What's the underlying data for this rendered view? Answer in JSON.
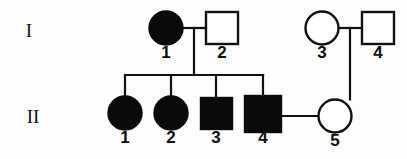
{
  "diagram": {
    "type": "pedigree",
    "generations": [
      {
        "id": "I",
        "label": "I",
        "label_x": 29,
        "label_y": 33
      },
      {
        "id": "II",
        "label": "II",
        "label_y": 119,
        "label_x": 33
      }
    ],
    "legend": {
      "filled_meaning": "affected",
      "open_meaning": "unaffected",
      "circle_meaning": "female",
      "square_meaning": "male"
    },
    "colors": {
      "ink": "#111111",
      "affected_fill": "#0a0a0a",
      "unaffected_fill": "#ffffff",
      "background": "#fdfdfd"
    },
    "individuals": [
      {
        "key": "I-1",
        "generation": "I",
        "number": "1",
        "sex": "female",
        "shape": "circle",
        "affected": true,
        "cx": 166,
        "cy": 28,
        "r": 16.5,
        "label_x": 166,
        "label_y": 46
      },
      {
        "key": "I-2",
        "generation": "I",
        "number": "2",
        "sex": "male",
        "shape": "square",
        "affected": false,
        "x": 206,
        "y": 12,
        "size": 32,
        "label_x": 222,
        "label_y": 46
      },
      {
        "key": "I-3",
        "generation": "I",
        "number": "3",
        "sex": "female",
        "shape": "circle",
        "affected": false,
        "cx": 322,
        "cy": 28,
        "r": 16.5,
        "label_x": 322,
        "label_y": 46
      },
      {
        "key": "I-4",
        "generation": "I",
        "number": "4",
        "sex": "male",
        "shape": "square",
        "affected": false,
        "x": 362,
        "y": 12,
        "size": 32,
        "label_x": 378,
        "label_y": 46
      },
      {
        "key": "II-1",
        "generation": "II",
        "number": "1",
        "sex": "female",
        "shape": "circle",
        "affected": true,
        "cx": 125,
        "cy": 113,
        "r": 16.5,
        "label_x": 125,
        "label_y": 131
      },
      {
        "key": "II-2",
        "generation": "II",
        "number": "2",
        "sex": "female",
        "shape": "circle",
        "affected": true,
        "cx": 171,
        "cy": 113,
        "r": 16.5,
        "label_x": 171,
        "label_y": 131
      },
      {
        "key": "II-3",
        "generation": "II",
        "number": "3",
        "sex": "male",
        "shape": "square",
        "affected": true,
        "x": 201,
        "y": 98,
        "size": 31,
        "label_x": 216,
        "label_y": 131
      },
      {
        "key": "II-4",
        "generation": "II",
        "number": "4",
        "sex": "male",
        "shape": "square",
        "affected": true,
        "x": 245,
        "y": 96,
        "size": 36,
        "label_x": 263,
        "label_y": 131
      },
      {
        "key": "II-5",
        "generation": "II",
        "number": "5",
        "sex": "female",
        "shape": "circle",
        "affected": false,
        "cx": 335,
        "cy": 116,
        "r": 16.5,
        "label_x": 335,
        "label_y": 134
      }
    ],
    "matings": [
      {
        "key": "I-1-x-I-2",
        "x1": 182.5,
        "y1": 28,
        "x2": 206,
        "y2": 28
      },
      {
        "key": "I-3-x-I-4",
        "x1": 338.5,
        "y1": 28,
        "x2": 362,
        "y2": 28
      },
      {
        "key": "II-4-x-II-5",
        "x1": 281,
        "y1": 116,
        "x2": 318.5,
        "y2": 116
      }
    ],
    "descent_lines": [
      {
        "key": "drop-from-I1-I2",
        "x1": 194,
        "y1": 28,
        "x2": 194,
        "y2": 75
      },
      {
        "key": "sibship-bar-gen2",
        "x1": 125,
        "y1": 75,
        "x2": 263,
        "y2": 75
      },
      {
        "key": "drop-to-II-1",
        "x1": 125,
        "y1": 75,
        "x2": 125,
        "y2": 97
      },
      {
        "key": "drop-to-II-2",
        "x1": 171,
        "y1": 75,
        "x2": 171,
        "y2": 97
      },
      {
        "key": "drop-to-II-3",
        "x1": 216,
        "y1": 75,
        "x2": 216,
        "y2": 98
      },
      {
        "key": "drop-to-II-4",
        "x1": 263,
        "y1": 75,
        "x2": 263,
        "y2": 96
      },
      {
        "key": "drop-from-I3-I4-to-II-5",
        "x1": 350,
        "y1": 28,
        "x2": 350,
        "y2": 99.5
      }
    ]
  }
}
